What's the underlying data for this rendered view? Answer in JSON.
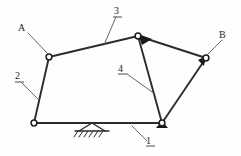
{
  "diagram": {
    "kind": "mechanism-kinematic-sketch",
    "canvas": {
      "width": 241,
      "height": 156
    },
    "background_color": "#fefefe",
    "line_color": "#2b2b33",
    "leader_color": "#55555f",
    "joint_fill_color": "#ffffff",
    "labels": {
      "A": "A",
      "B": "B",
      "one": "1",
      "two": "2",
      "three": "3",
      "four": "4"
    },
    "label_list": [
      {
        "text": "A",
        "kind": "point-label",
        "x": 22,
        "y": 29
      },
      {
        "text": "B",
        "kind": "point-label",
        "x": 223,
        "y": 36
      },
      {
        "text": "1",
        "kind": "link-number",
        "x": 150,
        "y": 142
      },
      {
        "text": "2",
        "kind": "link-number",
        "x": 19,
        "y": 77
      },
      {
        "text": "3",
        "kind": "link-number",
        "x": 118,
        "y": 12
      },
      {
        "text": "4",
        "kind": "link-number",
        "x": 122,
        "y": 70
      }
    ],
    "joints": [
      {
        "name": "joint-A",
        "x": 49,
        "y": 57
      },
      {
        "name": "joint-top",
        "x": 138,
        "y": 36
      },
      {
        "name": "joint-B",
        "x": 206,
        "y": 58
      },
      {
        "name": "joint-ground-left",
        "x": 34,
        "y": 123
      },
      {
        "name": "joint-ground-right",
        "x": 162,
        "y": 123
      }
    ],
    "links": [
      {
        "name": "link-1-frame",
        "from": "joint-ground-left",
        "to": "joint-ground-right"
      },
      {
        "name": "link-2-crank",
        "from": "joint-ground-left",
        "to": "joint-A"
      },
      {
        "name": "link-3-coupler",
        "from": "joint-A",
        "to": "joint-top"
      },
      {
        "name": "link-4-rocker",
        "from": "joint-top",
        "to": "joint-ground-right"
      },
      {
        "name": "link-top-to-B",
        "from": "joint-top",
        "to": "joint-B"
      },
      {
        "name": "link-B-to-ground-right",
        "from": "joint-B",
        "to": "joint-ground-right"
      }
    ],
    "ground_support": {
      "name": "fixed-pivot-ground-symbol",
      "apex_x": 92,
      "apex_y": 123,
      "base_y": 131,
      "base_left_x": 78,
      "base_right_x": 106,
      "hatch_count": 6
    }
  }
}
